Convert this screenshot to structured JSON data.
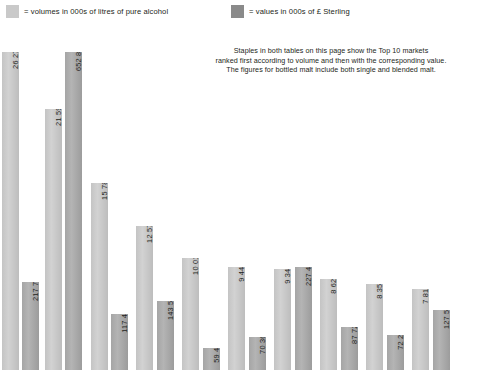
{
  "legend": {
    "volume": {
      "label": "= volumes in 000s of litres of pure alcohol",
      "color": "#c9c9c9",
      "icon": "legend-swatch"
    },
    "value": {
      "label": "= values in 000s of £ Sterling",
      "color": "#8a8a8a",
      "icon": "legend-swatch"
    }
  },
  "note": {
    "line1": "Staples in both tables on this page show the Top 10 markets",
    "line2": "ranked first according to volume and then with the corresponding value.",
    "line3": "The figures for bottled malt include both single and blended malt."
  },
  "chart_data": {
    "type": "bar",
    "title": "",
    "xlabel": "",
    "ylabel": "",
    "grid": false,
    "legend_position": "top",
    "categories": [
      "1",
      "2",
      "3",
      "4",
      "5",
      "6",
      "7",
      "8",
      "9",
      "10"
    ],
    "series": [
      {
        "name": "volumes in 000s of litres of pure alcohol",
        "color": "#c9c9c9",
        "values": [
          26278,
          21597,
          15787,
          12572,
          10015,
          9448,
          9342,
          8626,
          8352,
          7818
        ],
        "labels": [
          "26 278",
          "21 597",
          "15 787",
          "12 572",
          "10 015",
          "9 448",
          "9 342",
          "8 626",
          "8 352",
          "7 818"
        ]
      },
      {
        "name": "values in 000s of £ Sterling",
        "color": "#8a8a8a",
        "values": [
          217736,
          652839,
          117418,
          143540,
          59415,
          70368,
          227478,
          87722,
          72215,
          127509
        ],
        "labels": [
          "217 736",
          "652 839",
          "117 418",
          "143 540",
          "59 41",
          "70 368",
          "227 478",
          "87 722",
          "72 21",
          "127 509"
        ]
      }
    ],
    "bars": [
      {
        "label": "26 278",
        "series": "volume",
        "x": 2,
        "w": 17,
        "top": 28
      },
      {
        "label": "217 736",
        "series": "value",
        "x": 22,
        "w": 17,
        "top": 258
      },
      {
        "label": "21 597",
        "series": "volume",
        "x": 45,
        "w": 17,
        "top": 85
      },
      {
        "label": "652 839",
        "series": "value",
        "x": 65,
        "w": 17,
        "top": 28
      },
      {
        "label": "15 787",
        "series": "volume",
        "x": 91,
        "w": 17,
        "top": 159
      },
      {
        "label": "117 418",
        "series": "value",
        "x": 111,
        "w": 17,
        "top": 290
      },
      {
        "label": "12 572",
        "series": "volume",
        "x": 136,
        "w": 17,
        "top": 202
      },
      {
        "label": "143 540",
        "series": "value",
        "x": 157,
        "w": 17,
        "top": 277
      },
      {
        "label": "10 015",
        "series": "volume",
        "x": 182,
        "w": 17,
        "top": 234
      },
      {
        "label": "59 41",
        "series": "value",
        "x": 203,
        "w": 17,
        "top": 324
      },
      {
        "label": "9 448",
        "series": "volume",
        "x": 228,
        "w": 17,
        "top": 243
      },
      {
        "label": "70 368",
        "series": "value",
        "x": 249,
        "w": 17,
        "top": 313
      },
      {
        "label": "9 342",
        "series": "volume",
        "x": 274,
        "w": 17,
        "top": 245
      },
      {
        "label": "227 478",
        "series": "value",
        "x": 295,
        "w": 17,
        "top": 243
      },
      {
        "label": "8 626",
        "series": "volume",
        "x": 320,
        "w": 17,
        "top": 255
      },
      {
        "label": "87 722",
        "series": "value",
        "x": 341,
        "w": 17,
        "top": 303
      },
      {
        "label": "8 352",
        "series": "volume",
        "x": 366,
        "w": 17,
        "top": 260
      },
      {
        "label": "72 21",
        "series": "value",
        "x": 387,
        "w": 17,
        "top": 311
      },
      {
        "label": "7 818",
        "series": "volume",
        "x": 412,
        "w": 17,
        "top": 265
      },
      {
        "label": "127 509",
        "series": "value",
        "x": 433,
        "w": 17,
        "top": 286
      }
    ]
  }
}
